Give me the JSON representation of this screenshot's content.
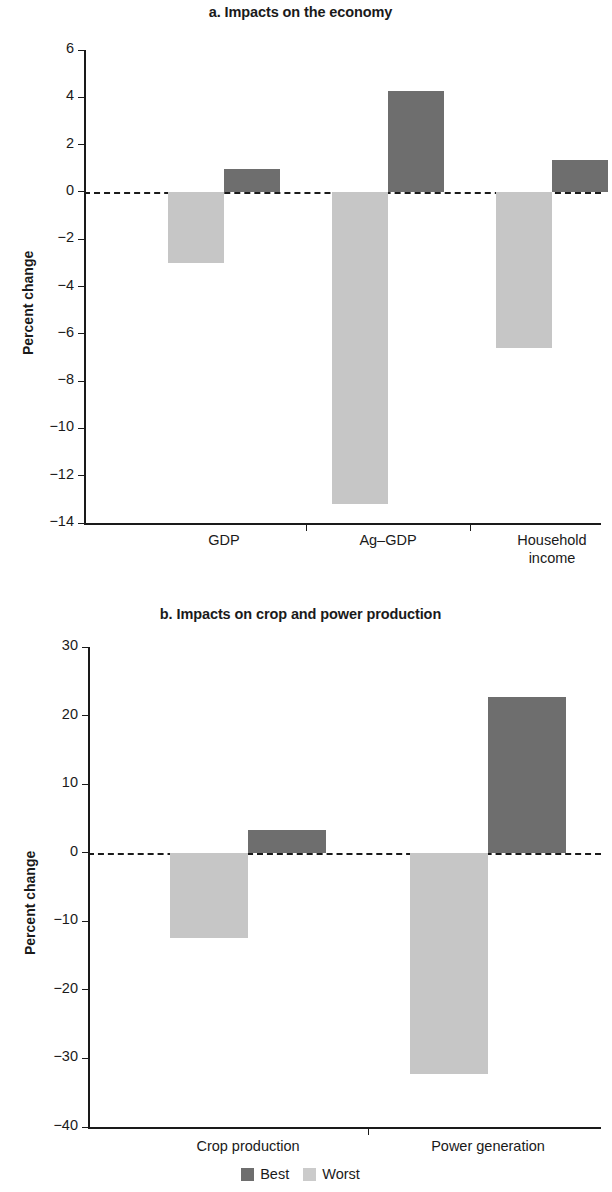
{
  "figure": {
    "ylabel": "Percent change",
    "legend": [
      {
        "label": "Best",
        "color": "#6e6e6e"
      },
      {
        "label": "Worst",
        "color": "#cbcbcb"
      }
    ]
  },
  "chart_data": [
    {
      "type": "bar",
      "title": "a. Impacts on the economy",
      "xlabel": "",
      "ylabel": "Percent change",
      "categories": [
        "GDP",
        "Ag–GDP",
        "Household\nincome"
      ],
      "series": [
        {
          "name": "Worst",
          "color": "#c6c6c6",
          "values": [
            -3.0,
            -13.2,
            -6.6
          ]
        },
        {
          "name": "Best",
          "color": "#6e6e6e",
          "values": [
            0.95,
            4.25,
            1.35
          ]
        }
      ],
      "ylim": [
        -14,
        6
      ],
      "yticks": [
        6,
        4,
        2,
        0,
        -2,
        -4,
        -6,
        -8,
        -10,
        -12,
        -14
      ],
      "yticklabels": [
        "6",
        "4",
        "2",
        "0",
        "−2",
        "−4",
        "−6",
        "−8",
        "−10",
        "−12",
        "−14"
      ],
      "grid": false,
      "zero_reference_line": true,
      "legend_position": "below-figure"
    },
    {
      "type": "bar",
      "title": "b. Impacts on crop and power production",
      "xlabel": "",
      "ylabel": "Percent change",
      "categories": [
        "Crop production",
        "Power generation"
      ],
      "series": [
        {
          "name": "Worst",
          "color": "#c6c6c6",
          "values": [
            -12.5,
            -32.2
          ]
        },
        {
          "name": "Best",
          "color": "#6e6e6e",
          "values": [
            3.3,
            22.7
          ]
        }
      ],
      "ylim": [
        -40,
        30
      ],
      "yticks": [
        30,
        20,
        10,
        0,
        -10,
        -20,
        -30,
        -40
      ],
      "yticklabels": [
        "30",
        "20",
        "10",
        "0",
        "−10",
        "−20",
        "−30",
        "−40"
      ],
      "grid": false,
      "zero_reference_line": true,
      "legend_position": "below-figure"
    }
  ]
}
